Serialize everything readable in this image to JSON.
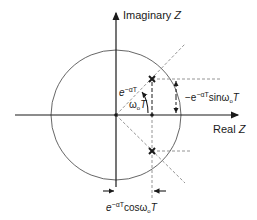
{
  "diagram": {
    "axes": {
      "imaginary_label": "Imaginary",
      "imaginary_var": "Z",
      "real_label": "Real",
      "real_var": "Z"
    },
    "labels": {
      "radius": {
        "base": "e",
        "exp": "−αT"
      },
      "angle": {
        "omega": "ω",
        "sub": "o",
        "T": "T"
      },
      "vertical_dim": {
        "prefix": "−e",
        "exp": "−αT",
        "func": "sinω",
        "sub": "o",
        "T": "T"
      },
      "horizontal_dim": {
        "base": "e",
        "exp": "−αT",
        "func": "cosω",
        "sub": "o",
        "T": "T"
      }
    },
    "poles": [
      {
        "name": "upper-pole",
        "marker": "X"
      },
      {
        "name": "lower-pole",
        "marker": "X"
      }
    ],
    "colors": {
      "ink": "#1a1a1a",
      "dashed": "#888888",
      "circle": "#555555"
    }
  }
}
